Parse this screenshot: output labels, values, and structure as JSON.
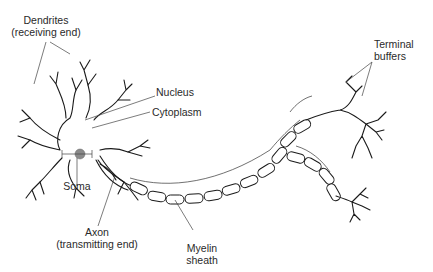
{
  "figure": {
    "colors": {
      "ink": "#1a1a1a",
      "nucleus": "#8a8a8a",
      "background": "#ffffff"
    }
  },
  "labels": {
    "dendrites": {
      "line1": "Dendrites",
      "line2": "(receiving end)"
    },
    "nucleus": "Nucleus",
    "cytoplasm": "Cytoplasm",
    "soma": "Soma",
    "axon": {
      "line1": "Axon",
      "line2": "(transmitting end)"
    },
    "myelin": {
      "line1": "Myelin",
      "line2": "sheath"
    },
    "terminal": {
      "line1": "Terminal",
      "line2": "buffers"
    }
  }
}
